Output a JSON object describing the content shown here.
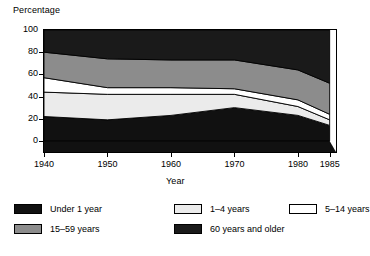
{
  "chart_data": {
    "type": "area",
    "title": "",
    "ylabel": "Percentage",
    "xlabel": "Year",
    "grid": false,
    "legend_position": "bottom",
    "x": [
      1940,
      1950,
      1960,
      1970,
      1980,
      1985
    ],
    "xlim": [
      1940,
      1986
    ],
    "ylim": [
      -10,
      100
    ],
    "xticks": [
      "1940",
      "1950",
      "1960",
      "1970",
      "1980",
      "1985"
    ],
    "yticks": [
      "0",
      "20",
      "40",
      "60",
      "80",
      "100"
    ],
    "stack_order_bottom_to_top": [
      "Under 1 year",
      "1–4 years",
      "5–14 years",
      "15–59 years",
      "60 years and older"
    ],
    "series": [
      {
        "name": "Under 1 year",
        "color": "#111111",
        "values": [
          22,
          19,
          23,
          30,
          23,
          14
        ]
      },
      {
        "name": "1–4 years",
        "color": "#ebebeb",
        "values": [
          22,
          23,
          19,
          12,
          8,
          5
        ]
      },
      {
        "name": "5–14 years",
        "color": "#ffffff",
        "values": [
          13,
          6,
          6,
          5,
          6,
          5
        ]
      },
      {
        "name": "15–59 years",
        "color": "#8c8c8c",
        "values": [
          23,
          26,
          25,
          26,
          27,
          28
        ]
      },
      {
        "name": "60 years and older",
        "color": "#1a1a1a",
        "values": [
          20,
          26,
          27,
          27,
          36,
          48
        ]
      }
    ],
    "cumulative_boundaries": {
      "under1_top": [
        22,
        19,
        23,
        30,
        23,
        14
      ],
      "age1to4_top": [
        44,
        42,
        42,
        42,
        31,
        19
      ],
      "age5to14_top": [
        57,
        48,
        48,
        47,
        37,
        24
      ],
      "age15to59_top": [
        80,
        74,
        73,
        73,
        64,
        52
      ],
      "age60_top": [
        100,
        100,
        100,
        100,
        100,
        100
      ]
    }
  },
  "legend": {
    "items": [
      {
        "label": "Under 1 year",
        "color": "#111111",
        "col": 0,
        "row": 0
      },
      {
        "label": "1–4 years",
        "color": "#ebebeb",
        "col": 1,
        "row": 0
      },
      {
        "label": "5–14 years",
        "color": "#ffffff",
        "col": 2,
        "row": 0
      },
      {
        "label": "15–59 years",
        "color": "#8c8c8c",
        "col": 0,
        "row": 1
      },
      {
        "label": "60 years and older",
        "color": "#1a1a1a",
        "col": 1,
        "row": 1
      }
    ]
  },
  "axes": {
    "y_title": "Percentage",
    "x_title": "Year"
  }
}
